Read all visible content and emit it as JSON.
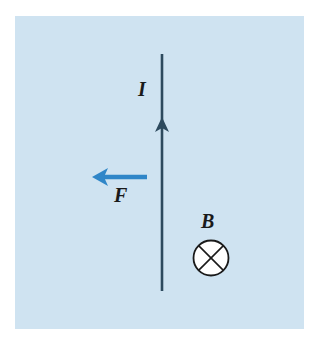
{
  "diagram": {
    "background_color": "#cfe3f1",
    "wire": {
      "label": "I",
      "direction": "up",
      "color": "#2d4a5e"
    },
    "force": {
      "label": "F",
      "direction": "left",
      "color": "#2f86c8"
    },
    "field": {
      "label": "B",
      "symbol": "into-page (⊗)",
      "color": "#1a1a1a"
    }
  }
}
